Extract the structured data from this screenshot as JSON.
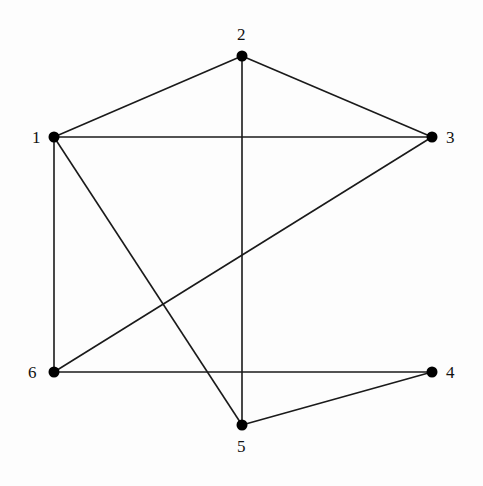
{
  "diagram": {
    "type": "undirected-graph",
    "nodes": [
      {
        "id": "1",
        "label": "1",
        "x": 54,
        "y": 137,
        "lx": 32,
        "ly": 143
      },
      {
        "id": "2",
        "label": "2",
        "x": 242,
        "y": 56,
        "lx": 237,
        "ly": 40
      },
      {
        "id": "3",
        "label": "3",
        "x": 432,
        "y": 137,
        "lx": 446,
        "ly": 143
      },
      {
        "id": "4",
        "label": "4",
        "x": 432,
        "y": 372,
        "lx": 446,
        "ly": 378
      },
      {
        "id": "5",
        "label": "5",
        "x": 242,
        "y": 425,
        "lx": 237,
        "ly": 452
      },
      {
        "id": "6",
        "label": "6",
        "x": 54,
        "y": 372,
        "lx": 28,
        "ly": 378
      }
    ],
    "edges": [
      [
        "1",
        "2"
      ],
      [
        "2",
        "3"
      ],
      [
        "1",
        "3"
      ],
      [
        "2",
        "5"
      ],
      [
        "1",
        "6"
      ],
      [
        "1",
        "5"
      ],
      [
        "3",
        "6"
      ],
      [
        "6",
        "4"
      ],
      [
        "5",
        "4"
      ]
    ],
    "colors": {
      "edge": "#1a1a1a",
      "node": "#000000",
      "background": "#fdfdfd"
    }
  }
}
